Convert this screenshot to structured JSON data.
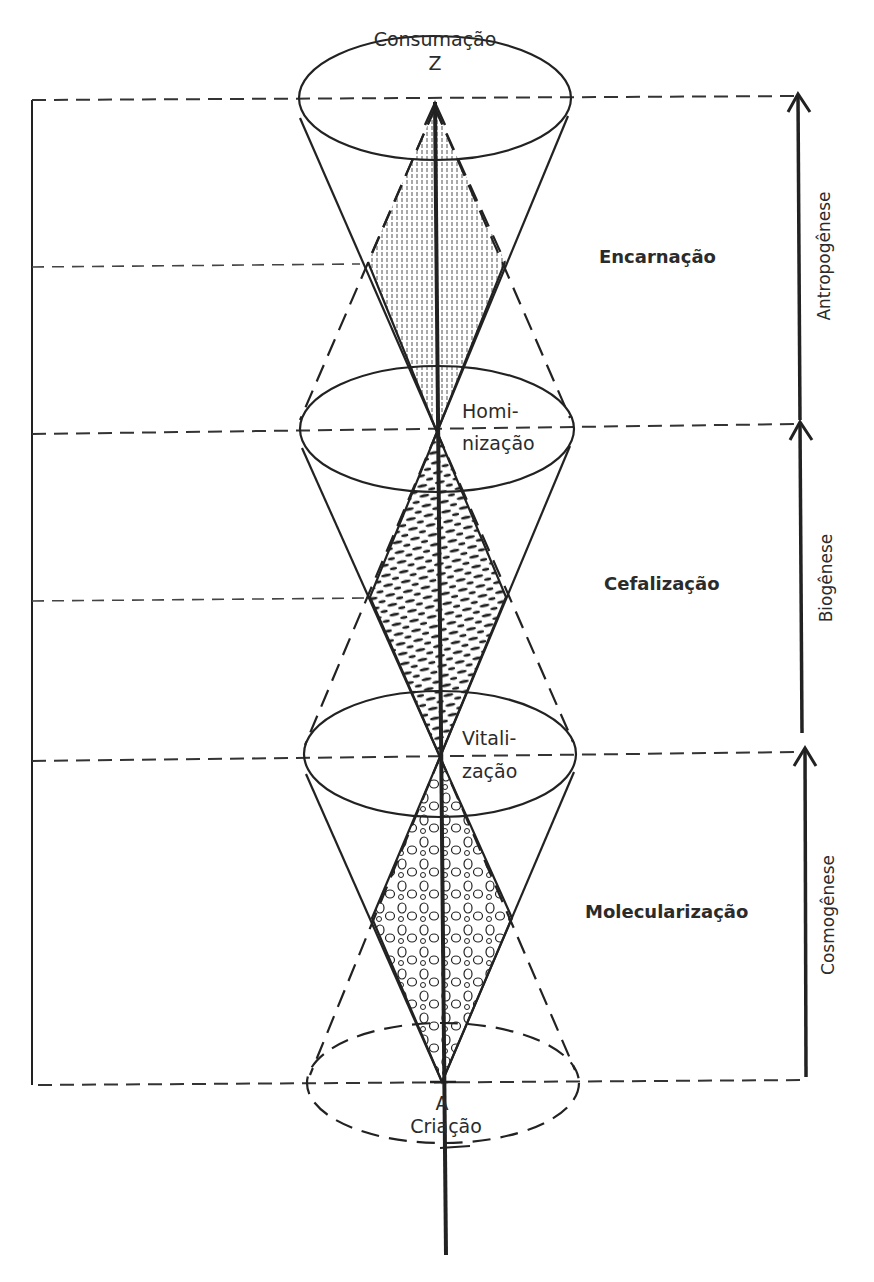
{
  "diagram": {
    "top_label": "Consumação",
    "top_point": "Z",
    "bottom_point": "A",
    "bottom_label": "Criação",
    "nodes": [
      {
        "id": "hominizacao",
        "label_line1": "Homi-",
        "label_line2": "nização"
      },
      {
        "id": "vitalizacao",
        "label_line1": "Vitali-",
        "label_line2": "zação"
      }
    ],
    "stages": [
      {
        "id": "encarnacao",
        "label": "Encarnação"
      },
      {
        "id": "cefalizacao",
        "label": "Cefalização"
      },
      {
        "id": "molecularizacao",
        "label": "Molecularização"
      }
    ],
    "phases": [
      {
        "id": "antropogenese",
        "label": "Antropogênese"
      },
      {
        "id": "biogenese",
        "label": "Biogênese"
      },
      {
        "id": "cosmogenese",
        "label": "Cosmogênese"
      }
    ],
    "colors": {
      "ink": "#222222",
      "paper": "#ffffff"
    }
  }
}
